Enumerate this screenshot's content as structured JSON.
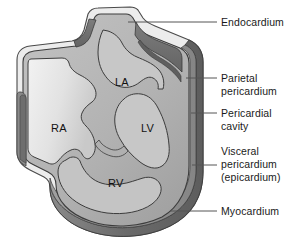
{
  "figure": {
    "background_color": "#ffffff",
    "text_color": "#1a1a1a",
    "leader_line_color": "#555555"
  },
  "chamber_labels": [
    {
      "id": "la",
      "text": "LA",
      "name": "left-atrium",
      "x": 115,
      "y": 76
    },
    {
      "id": "ra",
      "text": "RA",
      "name": "right-atrium",
      "x": 51,
      "y": 122
    },
    {
      "id": "lv",
      "text": "LV",
      "name": "left-ventricle",
      "x": 141,
      "y": 122
    },
    {
      "id": "rv",
      "text": "RV",
      "name": "right-ventricle",
      "x": 108,
      "y": 177
    }
  ],
  "callouts": [
    {
      "id": "endocardium",
      "lines": [
        "Endocardium"
      ],
      "name": "callout-endocardium",
      "text_x": 221,
      "text_y": 16,
      "leader": {
        "x1": 128,
        "y1": 22,
        "x2": 217,
        "y2": 22
      }
    },
    {
      "id": "parietal_pericardium",
      "lines": [
        "Parietal",
        "pericardium"
      ],
      "name": "callout-parietal-pericardium",
      "text_x": 221,
      "text_y": 72,
      "leader": {
        "x1": 186,
        "y1": 78,
        "x2": 217,
        "y2": 78
      }
    },
    {
      "id": "pericardial_cavity",
      "lines": [
        "Pericardial",
        "cavity"
      ],
      "name": "callout-pericardial-cavity",
      "text_x": 221,
      "text_y": 107,
      "leader": {
        "x1": 191,
        "y1": 113,
        "x2": 217,
        "y2": 113
      }
    },
    {
      "id": "visceral_pericardium",
      "lines": [
        "Visceral",
        "pericardium",
        "(epicardium)"
      ],
      "name": "callout-visceral-pericardium",
      "text_x": 221,
      "text_y": 145,
      "leader": {
        "x1": 192,
        "y1": 165,
        "x2": 217,
        "y2": 165
      }
    },
    {
      "id": "myocardium",
      "lines": [
        "Myocardium"
      ],
      "name": "callout-myocardium",
      "text_x": 221,
      "text_y": 205,
      "leader": {
        "x1": 170,
        "y1": 211,
        "x2": 217,
        "y2": 211
      }
    }
  ],
  "colors": {
    "outer_outline": "#4a4a4a",
    "parietal_layer": "#e8e8e8",
    "pericardial_cavity_band": "#6e6e6e",
    "visceral_layer": "#8c8c8c",
    "myocardium": "#b4b4b4",
    "chamber_ra": "#dcdcdc",
    "chamber_light": "#cfcfcf",
    "vessel_dark": "#6a6a6a",
    "vena_cava": "#7a7a7a",
    "inner_outline": "#3c3c3c"
  }
}
